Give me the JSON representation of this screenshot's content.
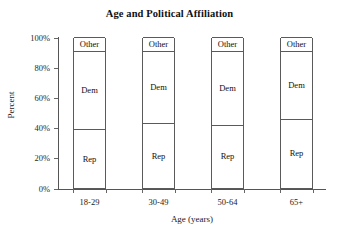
{
  "chart_data": {
    "type": "bar",
    "subtype": "stacked-bar-100-percent",
    "title": "Age and Political Affiliation",
    "xlabel": "Age (years)",
    "ylabel": "Percent",
    "categories": [
      "18-29",
      "30-49",
      "50-64",
      "65+"
    ],
    "ylim": [
      0,
      100
    ],
    "ytick_labels": [
      "0%",
      "20%",
      "40%",
      "60%",
      "80%",
      "100%"
    ],
    "ytick_values": [
      0,
      20,
      40,
      60,
      80,
      100
    ],
    "grid": false,
    "legend": "none (segments labeled in place)",
    "series": [
      {
        "name": "Rep",
        "values": [
          39,
          43,
          42,
          46
        ]
      },
      {
        "name": "Dem",
        "values": [
          52,
          48,
          49,
          45
        ]
      },
      {
        "name": "Other",
        "values": [
          9,
          9,
          9,
          9
        ]
      }
    ],
    "segment_order_bottom_to_top": [
      "Rep",
      "Dem",
      "Other"
    ],
    "bar_fill": "#ffffff",
    "bar_outline": "#5a5a5a",
    "annotations": []
  }
}
